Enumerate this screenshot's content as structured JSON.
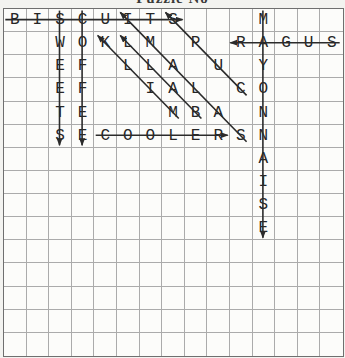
{
  "title": {
    "text": "Puzzle No"
  },
  "colors": {
    "background": "#f3f3f0",
    "grid_background": "#fcfcfa",
    "grid_line": "#ababab",
    "grid_border": "#6f6f6f",
    "letter": "#262626",
    "solution_line": "#2b2b2b"
  },
  "puzzle": {
    "grid": {
      "rows": 15,
      "cols": 15
    },
    "cells": [
      {
        "r": 0,
        "c": 0,
        "ch": "B"
      },
      {
        "r": 0,
        "c": 1,
        "ch": "I"
      },
      {
        "r": 0,
        "c": 2,
        "ch": "S"
      },
      {
        "r": 0,
        "c": 3,
        "ch": "C"
      },
      {
        "r": 0,
        "c": 4,
        "ch": "U"
      },
      {
        "r": 0,
        "c": 5,
        "ch": "I"
      },
      {
        "r": 0,
        "c": 6,
        "ch": "T"
      },
      {
        "r": 0,
        "c": 7,
        "ch": "S"
      },
      {
        "r": 0,
        "c": 11,
        "ch": "M"
      },
      {
        "r": 1,
        "c": 2,
        "ch": "W"
      },
      {
        "r": 1,
        "c": 3,
        "ch": "O"
      },
      {
        "r": 1,
        "c": 4,
        "ch": "K"
      },
      {
        "r": 1,
        "c": 5,
        "ch": "L"
      },
      {
        "r": 1,
        "c": 6,
        "ch": "M"
      },
      {
        "r": 1,
        "c": 8,
        "ch": "P"
      },
      {
        "r": 1,
        "c": 10,
        "ch": "R"
      },
      {
        "r": 1,
        "c": 11,
        "ch": "A"
      },
      {
        "r": 1,
        "c": 12,
        "ch": "G"
      },
      {
        "r": 1,
        "c": 13,
        "ch": "U"
      },
      {
        "r": 1,
        "c": 14,
        "ch": "S"
      },
      {
        "r": 2,
        "c": 2,
        "ch": "E"
      },
      {
        "r": 2,
        "c": 3,
        "ch": "F"
      },
      {
        "r": 2,
        "c": 5,
        "ch": "L"
      },
      {
        "r": 2,
        "c": 6,
        "ch": "L"
      },
      {
        "r": 2,
        "c": 7,
        "ch": "A"
      },
      {
        "r": 2,
        "c": 9,
        "ch": "U"
      },
      {
        "r": 2,
        "c": 11,
        "ch": "Y"
      },
      {
        "r": 3,
        "c": 2,
        "ch": "E"
      },
      {
        "r": 3,
        "c": 3,
        "ch": "F"
      },
      {
        "r": 3,
        "c": 6,
        "ch": "I"
      },
      {
        "r": 3,
        "c": 7,
        "ch": "A"
      },
      {
        "r": 3,
        "c": 8,
        "ch": "L"
      },
      {
        "r": 3,
        "c": 10,
        "ch": "C"
      },
      {
        "r": 3,
        "c": 11,
        "ch": "O"
      },
      {
        "r": 4,
        "c": 2,
        "ch": "T"
      },
      {
        "r": 4,
        "c": 3,
        "ch": "E"
      },
      {
        "r": 4,
        "c": 7,
        "ch": "M"
      },
      {
        "r": 4,
        "c": 8,
        "ch": "B"
      },
      {
        "r": 4,
        "c": 9,
        "ch": "A"
      },
      {
        "r": 4,
        "c": 11,
        "ch": "N"
      },
      {
        "r": 5,
        "c": 2,
        "ch": "S"
      },
      {
        "r": 5,
        "c": 3,
        "ch": "E"
      },
      {
        "r": 5,
        "c": 4,
        "ch": "C"
      },
      {
        "r": 5,
        "c": 5,
        "ch": "O"
      },
      {
        "r": 5,
        "c": 6,
        "ch": "O"
      },
      {
        "r": 5,
        "c": 7,
        "ch": "L"
      },
      {
        "r": 5,
        "c": 8,
        "ch": "E"
      },
      {
        "r": 5,
        "c": 9,
        "ch": "R"
      },
      {
        "r": 5,
        "c": 10,
        "ch": "S"
      },
      {
        "r": 5,
        "c": 11,
        "ch": "N"
      },
      {
        "r": 6,
        "c": 11,
        "ch": "A"
      },
      {
        "r": 7,
        "c": 11,
        "ch": "I"
      },
      {
        "r": 8,
        "c": 11,
        "ch": "S"
      },
      {
        "r": 9,
        "c": 11,
        "ch": "E"
      }
    ],
    "line_style": {
      "start_overshoot": 9,
      "end_overshoot": 10,
      "stroke_width": 1.6
    },
    "words": [
      {
        "word": "BISCUITS",
        "from": [
          0,
          0
        ],
        "to": [
          0,
          7
        ],
        "direction": "right"
      },
      {
        "word": "SUGAR",
        "from": [
          1,
          14
        ],
        "to": [
          1,
          10
        ],
        "direction": "left"
      },
      {
        "word": "SWEETS",
        "from": [
          0,
          2
        ],
        "to": [
          5,
          2
        ],
        "direction": "down"
      },
      {
        "word": "COFFEE",
        "from": [
          0,
          3
        ],
        "to": [
          5,
          3
        ],
        "direction": "down"
      },
      {
        "word": "COOLER",
        "from": [
          5,
          4
        ],
        "to": [
          5,
          9
        ],
        "direction": "right"
      },
      {
        "word": "MAYONNAISE",
        "from": [
          0,
          11
        ],
        "to": [
          9,
          11
        ],
        "direction": "down"
      },
      {
        "word": "MILK",
        "from": [
          4,
          7
        ],
        "to": [
          1,
          4
        ],
        "direction": "up-left"
      },
      {
        "word": "BALL",
        "from": [
          4,
          8
        ],
        "to": [
          1,
          5
        ],
        "direction": "up-left"
      },
      {
        "word": "SALAMI",
        "from": [
          5,
          10
        ],
        "to": [
          0,
          5
        ],
        "direction": "up-left"
      },
      {
        "word": "CUPS",
        "from": [
          3,
          10
        ],
        "to": [
          0,
          7
        ],
        "direction": "up-left"
      }
    ]
  }
}
